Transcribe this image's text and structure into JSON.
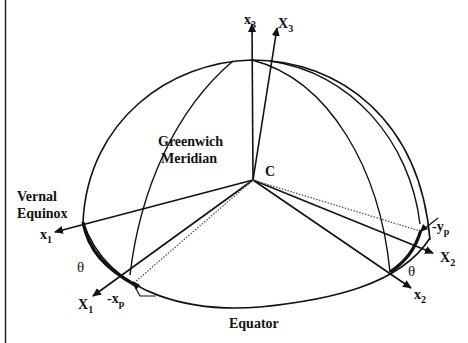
{
  "diagram": {
    "type": "celestial-sphere-axes",
    "labels": {
      "greenwich_line1": "Greenwich",
      "greenwich_line2": "Meridian",
      "center": "C",
      "vernal_line1": "Vernal",
      "vernal_line2": "Equinox",
      "equator": "Equator",
      "theta_left": "θ",
      "theta_right": "θ"
    },
    "axes": {
      "x3": {
        "base": "x",
        "sub": "3"
      },
      "X3": {
        "base": "X",
        "sub": "3"
      },
      "x1": {
        "base": "x",
        "sub": "1"
      },
      "X1": {
        "base": "X",
        "sub": "1"
      },
      "x2": {
        "base": "x",
        "sub": "2"
      },
      "X2": {
        "base": "X",
        "sub": "2"
      },
      "neg_xp": {
        "base": "-x",
        "sub": "p"
      },
      "neg_yp": {
        "base": "-y",
        "sub": "p"
      }
    },
    "colors": {
      "stroke": "#111111",
      "dotted": "#555555",
      "background": "#ffffff"
    }
  }
}
